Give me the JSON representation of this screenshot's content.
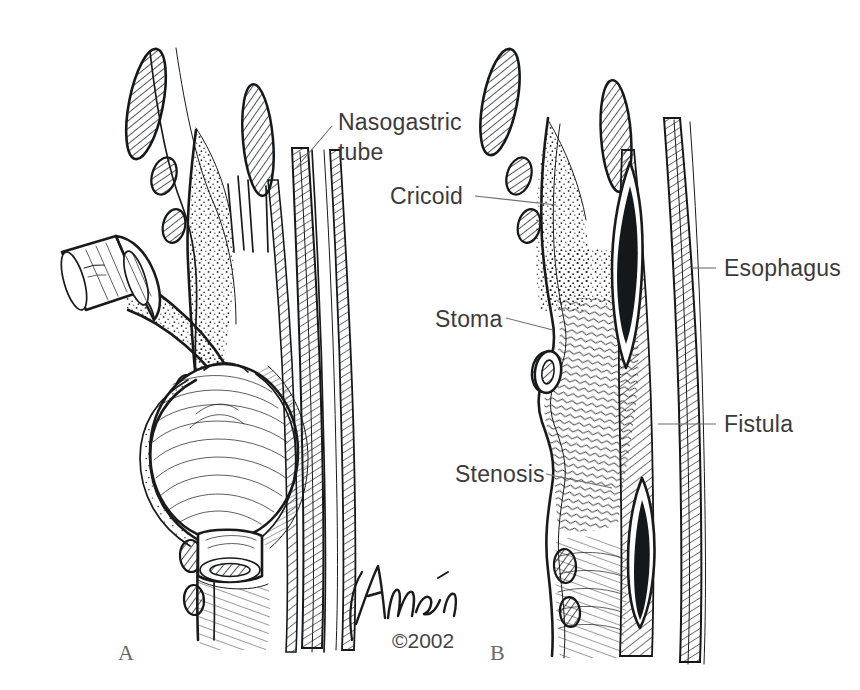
{
  "figure": {
    "background_color": "#ffffff",
    "ink_color": "#1a1a1a",
    "label_color": "#3b3b3b",
    "width": 860,
    "height": 690
  },
  "panels": [
    {
      "id": "A",
      "letter": "A",
      "caption": "Cuffed tracheostomy tube in place with inflated balloon"
    },
    {
      "id": "B",
      "letter": "B",
      "caption": "Resulting complications after tube removal"
    }
  ],
  "labels": [
    {
      "id": "nasogastric-tube",
      "text_lines": [
        "Nasogastric",
        "tube"
      ],
      "text": "Nasogastric tube",
      "panel": "A",
      "side": "right"
    },
    {
      "id": "cricoid",
      "text_lines": [
        "Cricoid"
      ],
      "text": "Cricoid",
      "panel": "B",
      "side": "left"
    },
    {
      "id": "esophagus",
      "text_lines": [
        "Esophagus"
      ],
      "text": "Esophagus",
      "panel": "B",
      "side": "right"
    },
    {
      "id": "stoma",
      "text_lines": [
        "Stoma"
      ],
      "text": "Stoma",
      "panel": "B",
      "side": "left"
    },
    {
      "id": "fistula",
      "text_lines": [
        "Fistula"
      ],
      "text": "Fistula",
      "panel": "B",
      "side": "right"
    },
    {
      "id": "stenosis",
      "text_lines": [
        "Stenosis"
      ],
      "text": "Stenosis",
      "panel": "B",
      "side": "left"
    }
  ],
  "credit": {
    "signature": "Tagén",
    "copyright": "©2002"
  }
}
